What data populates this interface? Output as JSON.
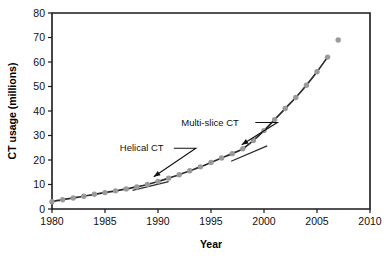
{
  "chart_data": {
    "type": "scatter",
    "title": "",
    "xlabel": "Year",
    "ylabel": "CT usage (millions)",
    "xlim": [
      1980,
      2010
    ],
    "ylim": [
      0,
      80
    ],
    "xticks": [
      1980,
      1985,
      1990,
      1995,
      2000,
      2005,
      2010
    ],
    "xticklabels": [
      "1980",
      "1985",
      "1990",
      "1995",
      "2000",
      "2005",
      "2010"
    ],
    "yticks": [
      0,
      10,
      20,
      30,
      40,
      50,
      60,
      70,
      80
    ],
    "yticklabels": [
      "0",
      "10",
      "20",
      "30",
      "40",
      "50",
      "60",
      "70",
      "80"
    ],
    "grid": false,
    "legend": "none",
    "series": [
      {
        "name": "CT usage",
        "marker": "circle",
        "marker_color": "#9a9a9a",
        "line_color": "#2b2b2b",
        "x": [
          1980,
          1981,
          1982,
          1983,
          1984,
          1985,
          1986,
          1987,
          1988,
          1989,
          1990,
          1991,
          1992,
          1993,
          1994,
          1995,
          1996,
          1997,
          1998,
          1999,
          2000,
          2001,
          2002,
          2003,
          2004,
          2005,
          2006,
          2007
        ],
        "values": [
          3.0,
          3.8,
          4.5,
          5.2,
          6.0,
          6.7,
          7.4,
          8.2,
          9.0,
          10.0,
          11.2,
          12.6,
          14.0,
          15.6,
          17.2,
          19.0,
          20.8,
          22.6,
          24.6,
          28.0,
          32.0,
          36.5,
          41.0,
          45.5,
          50.5,
          56.0,
          62.0,
          69.0
        ]
      }
    ],
    "annotations": [
      {
        "label": "Helical CT",
        "label_x": 1986.4,
        "label_y": 23.5,
        "target_x": 1989.6,
        "target_y": 11.5,
        "tangent": {
          "x1": 1987.6,
          "y1": 7.6,
          "x2": 1991.0,
          "y2": 11.2
        }
      },
      {
        "label": "Multi-slice CT",
        "label_x": 1992.2,
        "label_y": 34.0,
        "target_x": 1997.9,
        "target_y": 24.6,
        "tangent": {
          "x1": 1996.9,
          "y1": 19.5,
          "x2": 2000.3,
          "y2": 25.8
        }
      }
    ]
  },
  "colors": {
    "marker": "#9a9a9a",
    "line": "#2b2b2b",
    "axis": "#1a1a1a",
    "text": "#111111",
    "background": "#ffffff"
  }
}
